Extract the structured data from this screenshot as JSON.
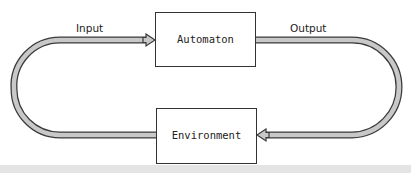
{
  "diagram": {
    "nodes": [
      {
        "id": "automaton",
        "label": "Automaton"
      },
      {
        "id": "environment",
        "label": "Environment"
      }
    ],
    "edges": [
      {
        "id": "input",
        "label": "Input",
        "from": "environment",
        "to": "automaton"
      },
      {
        "id": "output",
        "label": "Output",
        "from": "automaton",
        "to": "environment"
      }
    ],
    "colors": {
      "arrow_fill": "#c8c8c8",
      "arrow_stroke": "#3a3a3a",
      "box_stroke": "#333333",
      "box_fill": "#ffffff",
      "bottom_strip": "#e4e4e4"
    }
  }
}
